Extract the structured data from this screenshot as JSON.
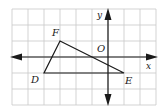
{
  "diagram": {
    "type": "coordinate-grid-triangle",
    "grid": {
      "x_min": -6,
      "x_max": 3,
      "y_min": -3,
      "y_max": 3,
      "cell_px": 16,
      "origin_px": [
        108,
        57
      ],
      "line_color": "#c8c8c8"
    },
    "axes": {
      "x_label": "x",
      "y_label": "y",
      "origin_label": "O",
      "color": "#1a1a1a"
    },
    "triangle": {
      "name": "DEF",
      "vertices": [
        {
          "label": "F",
          "x": -3,
          "y": 1
        },
        {
          "label": "E",
          "x": 1,
          "y": -1
        },
        {
          "label": "D",
          "x": -4,
          "y": -1
        }
      ]
    }
  }
}
